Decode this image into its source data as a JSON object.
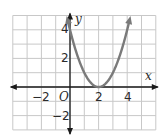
{
  "chart_data": {
    "type": "line",
    "title": "",
    "xlabel": "x",
    "ylabel": "y",
    "origin_label": "O",
    "xlim": [
      -4,
      6
    ],
    "ylim": [
      -3,
      5
    ],
    "grid": true,
    "x_ticks": [
      {
        "value": -2,
        "label": "−2"
      },
      {
        "value": 2,
        "label": "2"
      },
      {
        "value": 4,
        "label": "4"
      }
    ],
    "y_ticks": [
      {
        "value": 4,
        "label": "4"
      },
      {
        "value": 2,
        "label": "2"
      },
      {
        "value": -2,
        "label": "−2"
      }
    ],
    "series": [
      {
        "name": "parabola",
        "equation": "y = (x - 2)^2",
        "vertex": [
          2,
          0
        ],
        "x": [
          -0.2,
          0,
          0.5,
          1,
          1.5,
          2,
          2.5,
          3,
          3.5,
          4,
          4.2
        ],
        "y": [
          4.84,
          4,
          2.25,
          1,
          0.25,
          0,
          0.25,
          1,
          2.25,
          4,
          4.84
        ],
        "color": "#7a7a7a",
        "arrows_at_ends": true
      }
    ]
  },
  "colors": {
    "grid": "#c8c8c8",
    "axis": "#1a1a1a",
    "curve": "#7a7a7a",
    "background": "#ffffff"
  }
}
